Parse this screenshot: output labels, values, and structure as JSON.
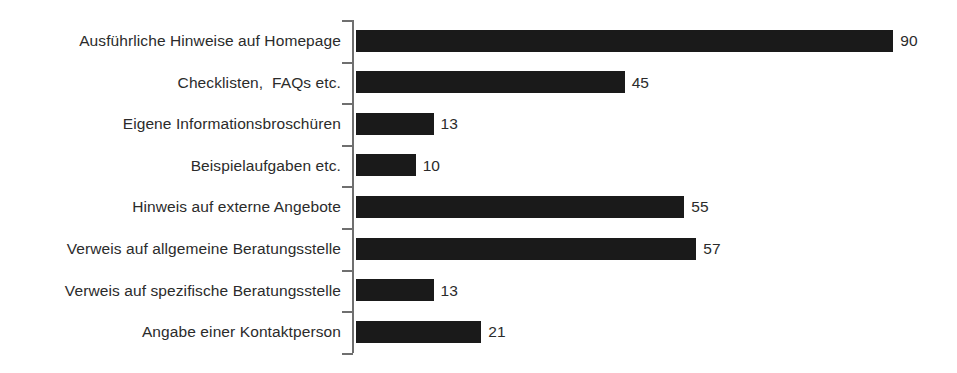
{
  "chart_data": {
    "type": "bar",
    "orientation": "horizontal",
    "title": "",
    "subtitle": "",
    "xlabel": "",
    "ylabel": "",
    "grid": false,
    "legend": false,
    "legend_position": "none",
    "axis_visible": "category-axis-only",
    "value_labels_shown": true,
    "xlim": [
      0,
      100
    ],
    "categories": [
      "Ausführliche Hinweise auf Homepage",
      "Checklisten,  FAQs etc.",
      "Eigene Informationsbroschüren",
      "Beispielaufgaben etc.",
      "Hinweis auf externe Angebote",
      "Verweis auf allgemeine Beratungsstelle",
      "Verweis auf spezifische Beratungsstelle",
      "Angabe einer Kontaktperson"
    ],
    "values": [
      90,
      45,
      13,
      10,
      55,
      57,
      13,
      21
    ],
    "value_label_text": [
      "90",
      "45",
      "13",
      "10",
      "55",
      "57",
      "13",
      "21"
    ],
    "bar_color": "#1a1a1a",
    "axis_color": "#6f6f6f",
    "text_color": "#2b2b2b",
    "background_color": "#ffffff"
  }
}
